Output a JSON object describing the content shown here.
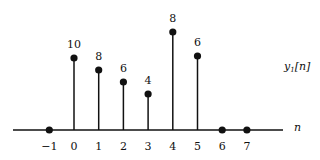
{
  "chart_data": {
    "type": "stem",
    "title": "",
    "xlabel": "n",
    "ylabel": "y1[n]",
    "series_label": "y1[n]",
    "x": [
      -1,
      0,
      1,
      2,
      3,
      4,
      5,
      6,
      7
    ],
    "values": [
      0,
      10,
      8,
      6,
      4,
      8,
      6,
      0,
      0
    ],
    "value_labels": [
      "",
      "10",
      "8",
      "6",
      "4",
      "8",
      "6",
      "",
      ""
    ],
    "tick_labels": [
      "−1",
      "0",
      "1",
      "2",
      "3",
      "4",
      "5",
      "6",
      "7"
    ],
    "stem_top_y_px": [
      130,
      58,
      70,
      82,
      94,
      32,
      56,
      130,
      130
    ],
    "grid": false,
    "legend": "none"
  },
  "style": {
    "ink": "#111111",
    "background": "#ffffff"
  },
  "labels": {
    "x_axis": "n",
    "y_name": "y",
    "y_sub": "1",
    "y_arg": "[n]"
  }
}
